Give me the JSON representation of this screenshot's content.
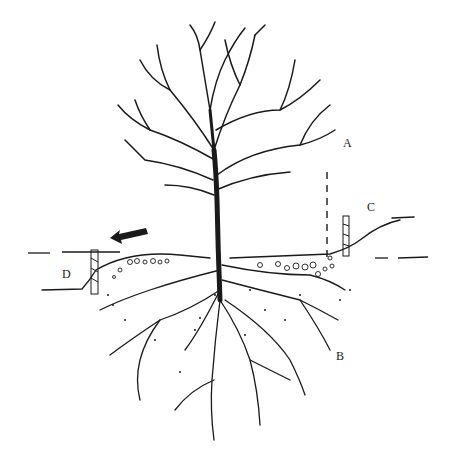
{
  "diagram": {
    "labels": [
      {
        "id": "A",
        "text": "A",
        "x": 343,
        "y": 143
      },
      {
        "id": "B",
        "text": "B",
        "x": 336,
        "y": 356
      },
      {
        "id": "C",
        "text": "C",
        "x": 368,
        "y": 206
      },
      {
        "id": "D",
        "text": "D",
        "x": 62,
        "y": 272
      }
    ],
    "colors": {
      "ink": "#1a1a1a",
      "background": "#ffffff"
    }
  }
}
